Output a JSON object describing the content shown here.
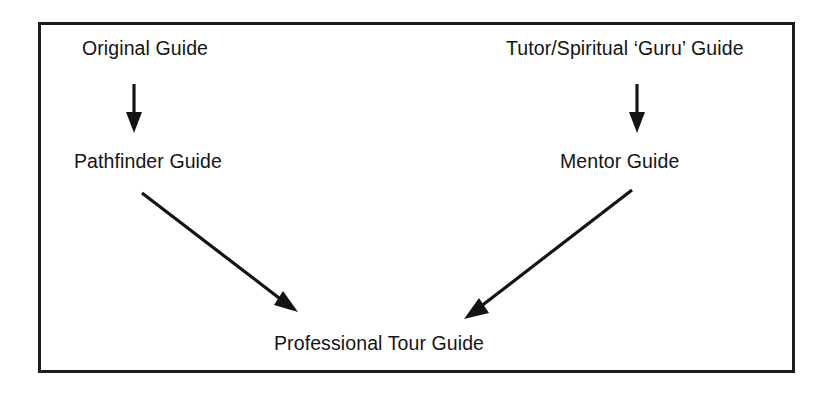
{
  "diagram": {
    "frame": {
      "border_color": "#1c1c1c",
      "background": "#ffffff"
    },
    "text_color": "#141414",
    "nodes": [
      {
        "id": "original",
        "label": "Original Guide"
      },
      {
        "id": "tutor",
        "label": "Tutor/Spiritual ‘Guru’ Guide"
      },
      {
        "id": "pathfinder",
        "label": "Pathfinder Guide"
      },
      {
        "id": "mentor",
        "label": "Mentor Guide"
      },
      {
        "id": "prof",
        "label": "Professional Tour Guide"
      }
    ],
    "edges": [
      {
        "id": "original-to-pathfinder",
        "from": "original",
        "to": "pathfinder",
        "style": "vertical-arrow-down"
      },
      {
        "id": "tutor-to-mentor",
        "from": "tutor",
        "to": "mentor",
        "style": "vertical-arrow-down"
      },
      {
        "id": "pathfinder-to-prof",
        "from": "pathfinder",
        "to": "prof",
        "style": "diagonal-arrow-down-right"
      },
      {
        "id": "mentor-to-prof",
        "from": "mentor",
        "to": "prof",
        "style": "diagonal-arrow-down-left"
      }
    ]
  }
}
